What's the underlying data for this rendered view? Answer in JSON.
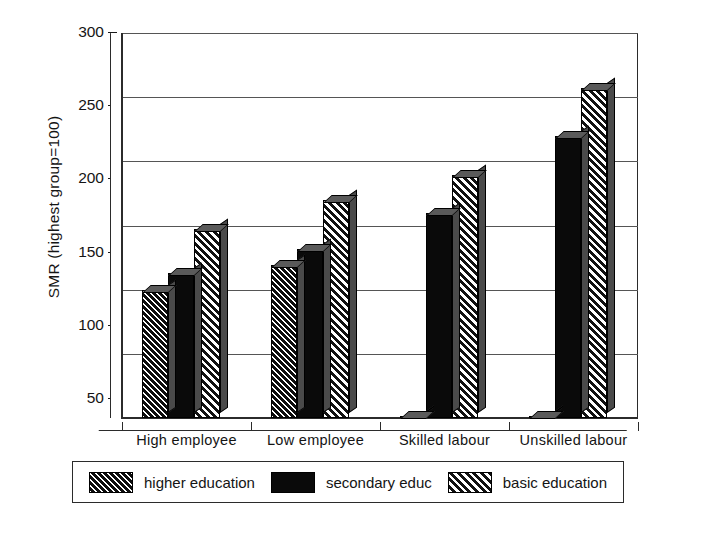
{
  "chart_data": {
    "type": "bar",
    "title": "",
    "subtitle": "",
    "xlabel": "",
    "ylabel": "SMR (highest group=100)",
    "categories": [
      "High employee",
      "Low employee",
      "Skilled labour",
      "Unskilled labour"
    ],
    "series": [
      {
        "name": "higher education",
        "values": [
          100,
          119,
          1,
          1
        ]
      },
      {
        "name": "secondary educ",
        "values": [
          113,
          132,
          160,
          220
        ]
      },
      {
        "name": "basic education",
        "values": [
          147,
          170,
          189,
          257
        ]
      }
    ],
    "ylim": [
      0,
      300
    ],
    "yticks": [
      0,
      50,
      100,
      150,
      200,
      250,
      300
    ],
    "ytick_labels": [
      "0",
      "50",
      "100",
      "150",
      "200",
      "250",
      "300"
    ],
    "grid": true,
    "grid_axis": "y",
    "legend_position": "bottom",
    "style": "3d-grayscale-hatched"
  },
  "legend": {
    "items": [
      {
        "label": "higher education",
        "pattern": "dense-diagonal-hatch"
      },
      {
        "label": "secondary educ",
        "pattern": "solid-black"
      },
      {
        "label": "basic education",
        "pattern": "light-diagonal-hatch"
      }
    ]
  },
  "colors": {
    "axis": "#2b2b2b",
    "grid": "#555555",
    "bar_dark": "#0d0d0d",
    "bar_side": "#4a4a4a",
    "background": "#ffffff",
    "text": "#141414"
  }
}
